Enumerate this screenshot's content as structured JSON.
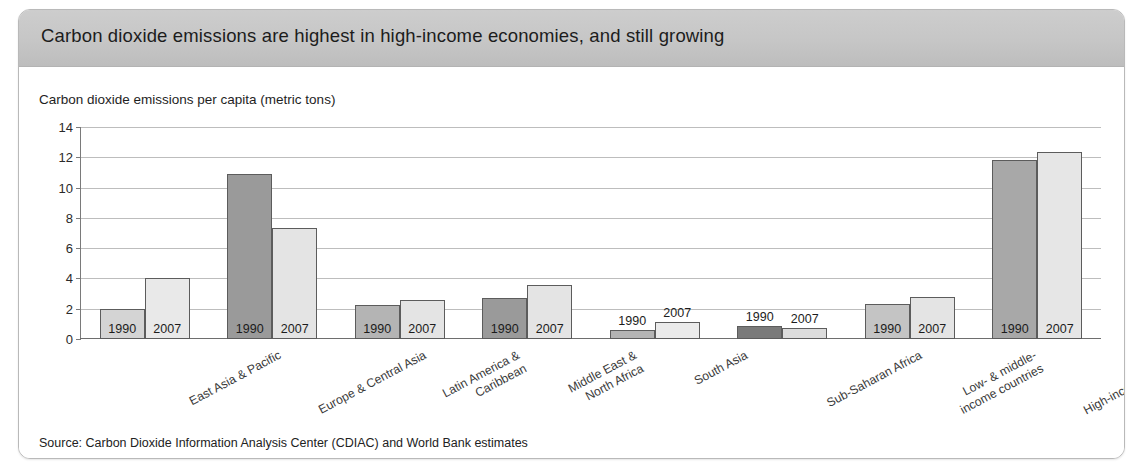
{
  "figure": {
    "title": "Carbon dioxide emissions are highest in high-income economies, and still growing",
    "axis_title": "Carbon dioxide emissions per capita (metric tons)",
    "source": "Source: Carbon Dioxide Information Analysis Center (CDIAC) and World Bank estimates",
    "colors": {
      "header_band": "#c6c6c6",
      "frame_border": "#b9b9b9",
      "gridline": "#bdbdbd",
      "axis": "#6e6e6e",
      "bar_1990_light": "#d4d4d4",
      "bar_1990_medium": "#b0b0b0",
      "bar_1990_dark": "#8e8e8e",
      "bar_1990_darkest": "#707070",
      "bar_2007": "#e9e9e9"
    }
  },
  "chart_data": {
    "type": "bar",
    "title": "Carbon dioxide emissions are highest in high-income economies, and still growing",
    "subtitle": "Carbon dioxide emissions per capita (metric tons)",
    "xlabel": "",
    "ylabel": "Carbon dioxide emissions per capita (metric tons)",
    "ylim": [
      0,
      14
    ],
    "yticks": [
      0,
      2,
      4,
      6,
      8,
      10,
      12,
      14
    ],
    "ytick_labels": [
      "0",
      "2",
      "4",
      "6",
      "8",
      "10",
      "12",
      "14"
    ],
    "grid": true,
    "legend": "none",
    "series_labels": [
      "1990",
      "2007"
    ],
    "categories": [
      "East Asia & Pacific",
      "Europe & Central Asia",
      "Latin America &\nCaribbean",
      "Middle East &\nNorth Africa",
      "South Asia",
      "Sub-Saharan Africa",
      "Low- & middle-\nincome countries",
      "High-income countries"
    ],
    "series": [
      {
        "name": "1990",
        "values": [
          2.0,
          10.9,
          2.25,
          2.7,
          0.6,
          0.85,
          2.3,
          11.85
        ]
      },
      {
        "name": "2007",
        "values": [
          4.0,
          7.3,
          2.6,
          3.6,
          1.15,
          0.75,
          2.8,
          12.35
        ]
      }
    ],
    "bar_fills_1990": [
      "#d4d4d4",
      "#9a9a9a",
      "#b4b4b4",
      "#9a9a9a",
      "#b4b4b4",
      "#7a7a7a",
      "#c4c4c4",
      "#a8a8a8"
    ],
    "bar_fills_2007": [
      "#e9e9e9",
      "#e4e4e4",
      "#e4e4e4",
      "#e4e4e4",
      "#ebebeb",
      "#dcdcdc",
      "#e4e4e4",
      "#e6e6e6"
    ],
    "label_inside": [
      true,
      true,
      true,
      true,
      false,
      false,
      true,
      true
    ]
  }
}
